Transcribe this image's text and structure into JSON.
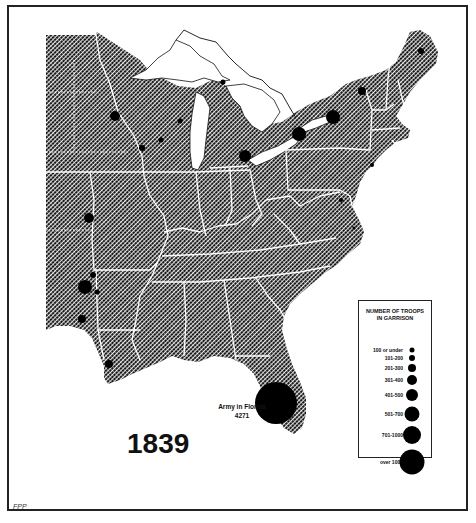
{
  "map": {
    "year_label": "1839",
    "credit": "FPP",
    "florida_annotation": {
      "line1": "Army in Florida",
      "line2": "4271"
    },
    "colors": {
      "land_hatch": "#1a1a1a",
      "land_bg": "#ffffff",
      "borders": "#ffffff",
      "garrison": "#000000",
      "frame": "#222222"
    }
  },
  "legend": {
    "title_line1": "NUMBER OF TROOPS",
    "title_line2": "IN GARRISON",
    "items": [
      {
        "label": "100 or under",
        "size": 5,
        "y": 49
      },
      {
        "label": "101-200",
        "size": 6,
        "y": 57
      },
      {
        "label": "201-300",
        "size": 8,
        "y": 67
      },
      {
        "label": "301-400",
        "size": 10,
        "y": 79
      },
      {
        "label": "401-500",
        "size": 12,
        "y": 94
      },
      {
        "label": "501-700",
        "size": 15,
        "y": 113
      },
      {
        "label": "701-1000",
        "size": 18,
        "y": 134
      },
      {
        "label": "over 1000",
        "size": 25,
        "y": 161
      }
    ]
  },
  "garrisons": [
    {
      "name": "florida-army",
      "x": 276,
      "y": 403,
      "r": 21,
      "troops": "4271"
    },
    {
      "name": "sackets-harbor",
      "x": 333,
      "y": 117,
      "r": 7
    },
    {
      "name": "fort-niagara",
      "x": 299,
      "y": 134,
      "r": 7
    },
    {
      "name": "detroit",
      "x": 245,
      "y": 156,
      "r": 6
    },
    {
      "name": "plattsburgh",
      "x": 362,
      "y": 91,
      "r": 4
    },
    {
      "name": "houlton",
      "x": 421,
      "y": 51,
      "r": 3
    },
    {
      "name": "fort-snelling",
      "x": 115,
      "y": 116,
      "r": 5
    },
    {
      "name": "fort-crawford",
      "x": 142,
      "y": 148,
      "r": 3
    },
    {
      "name": "fort-winnebago",
      "x": 161,
      "y": 140,
      "r": 2.5
    },
    {
      "name": "fort-howard",
      "x": 180,
      "y": 121,
      "r": 2.5
    },
    {
      "name": "mackinac",
      "x": 223,
      "y": 82,
      "r": 2.5
    },
    {
      "name": "fort-leavenworth",
      "x": 89,
      "y": 218,
      "r": 5
    },
    {
      "name": "fort-gibson",
      "x": 85,
      "y": 287,
      "r": 7
    },
    {
      "name": "fort-smith",
      "x": 93,
      "y": 275,
      "r": 3
    },
    {
      "name": "fort-coffee",
      "x": 97,
      "y": 292,
      "r": 2.5
    },
    {
      "name": "fort-towson",
      "x": 82,
      "y": 319,
      "r": 4
    },
    {
      "name": "fort-jesup",
      "x": 109,
      "y": 364,
      "r": 4
    },
    {
      "name": "new-york",
      "x": 372,
      "y": 165,
      "r": 2
    },
    {
      "name": "washington",
      "x": 341,
      "y": 200,
      "r": 2
    },
    {
      "name": "fort-monroe",
      "x": 354,
      "y": 228,
      "r": 1.5
    }
  ]
}
